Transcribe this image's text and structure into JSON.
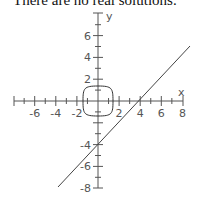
{
  "caption": "There are no real solutions.",
  "chart_data": {
    "type": "line",
    "title": "",
    "xlabel": "x",
    "ylabel": "y",
    "xlim": [
      -8,
      8
    ],
    "ylim": [
      -8,
      8
    ],
    "x_tick_labels": [
      "-6",
      "-4",
      "-2",
      "2",
      "4",
      "6",
      "8"
    ],
    "y_tick_labels": [
      "6",
      "4",
      "2",
      "-4",
      "-6",
      "-8"
    ],
    "grid": false,
    "series": [
      {
        "name": "line",
        "kind": "line",
        "equation": "y = x - 4",
        "points": [
          [
            -2.3,
            -6.3
          ],
          [
            8.7,
            5.1
          ]
        ]
      },
      {
        "name": "closed curve",
        "kind": "closed-curve",
        "center": [
          0,
          0
        ],
        "half_width": 1.35,
        "half_height": 1.35,
        "shape": "rounded square"
      }
    ],
    "intersections": []
  }
}
